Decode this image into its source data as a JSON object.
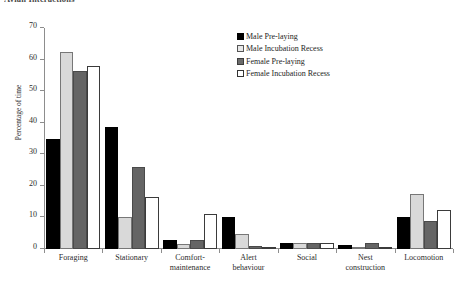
{
  "caption_fragment": "Avian Interactions",
  "chart_data": {
    "type": "bar",
    "title": "",
    "xlabel": "",
    "ylabel": "Percentage of time",
    "ylim": [
      0,
      70
    ],
    "yticks": [
      0,
      10,
      20,
      30,
      40,
      50,
      60,
      70
    ],
    "grid": false,
    "legend_position": "top-right",
    "categories": [
      "Foraging",
      "Stationary",
      "Comfort-maintenance",
      "Alert behaviour",
      "Social",
      "Nest construction",
      "Locomotion"
    ],
    "category_lines": [
      [
        "Foraging"
      ],
      [
        "Stationary"
      ],
      [
        "Comfort-",
        "maintenance"
      ],
      [
        "Alert",
        "behaviour"
      ],
      [
        "Social"
      ],
      [
        "Nest",
        "construction"
      ],
      [
        "Locomotion"
      ]
    ],
    "series": [
      {
        "name": "Male Pre-laying",
        "color": "#000000",
        "values": [
          35.0,
          38.5,
          3.0,
          10.0,
          2.0,
          1.3,
          10.0
        ]
      },
      {
        "name": "Male Incubation Recess",
        "color": "#d9d9d9",
        "values": [
          62.5,
          10.0,
          1.5,
          4.8,
          2.0,
          0.3,
          17.5
        ]
      },
      {
        "name": "Female Pre-laying",
        "color": "#656565",
        "values": [
          56.5,
          26.0,
          3.0,
          0.8,
          2.0,
          2.0,
          9.0
        ]
      },
      {
        "name": "Female Incubation Recess",
        "color": "#ffffff",
        "values": [
          58.0,
          16.5,
          11.0,
          0.3,
          2.0,
          0.6,
          12.5
        ]
      }
    ]
  }
}
